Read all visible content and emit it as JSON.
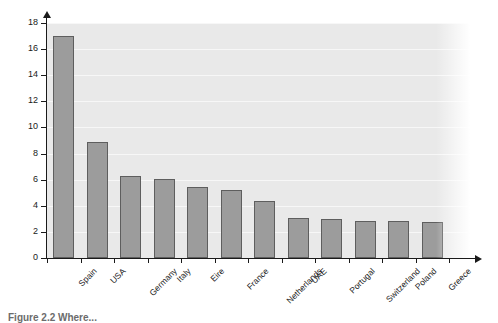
{
  "chart_data": {
    "type": "bar",
    "title": "",
    "xlabel": "",
    "ylabel": "Percentage of passengers",
    "ylim": [
      0,
      18
    ],
    "ytick_values": [
      0,
      2,
      4,
      6,
      8,
      10,
      12,
      14,
      16,
      18
    ],
    "ytick_labels": [
      "0",
      "2",
      "4",
      "6",
      "8",
      "10",
      "12",
      "14",
      "16",
      "18"
    ],
    "grid": true,
    "legend": null,
    "categories": [
      "Spain",
      "USA",
      "Germany",
      "Italy",
      "Eire",
      "France",
      "Netherlands",
      "UAE",
      "Portugal",
      "Switzerland",
      "Poland",
      "Greece"
    ],
    "values": [
      17.0,
      8.9,
      6.3,
      6.05,
      5.45,
      5.2,
      4.4,
      3.1,
      3.0,
      2.85,
      2.8,
      2.75
    ],
    "bar_color": "#9c9c9c",
    "bar_edge_color": "#5e5e5e",
    "panel_color": "#e9e9e9",
    "gridline_color": "#f7f7f7",
    "axis_color": "#1a1a1a"
  },
  "caption": {
    "text": "Figure 2.2 Where..."
  }
}
